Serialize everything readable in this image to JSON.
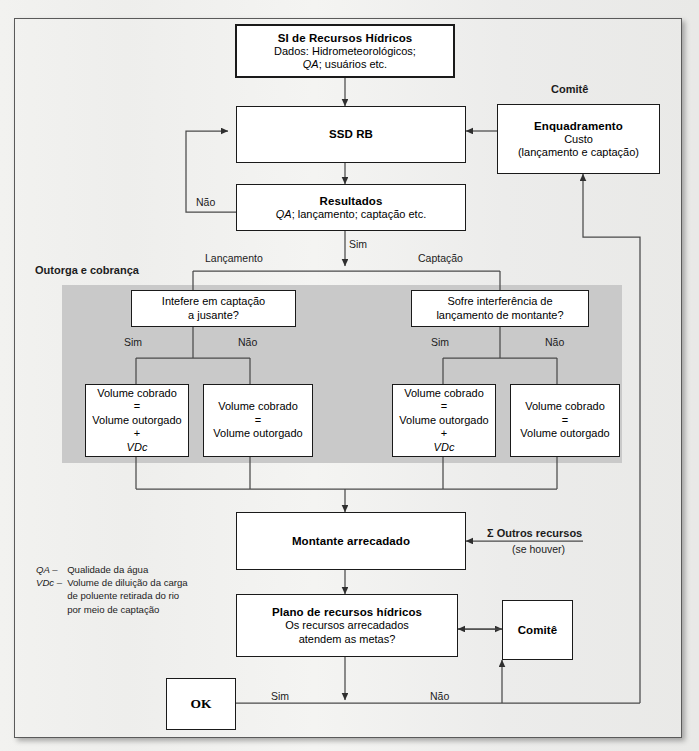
{
  "diagram": {
    "section_labels": {
      "outorga": "Outorga e cobrança",
      "comite_top": "Comitê"
    },
    "nodes": {
      "si": {
        "title": "SI de Recursos Hídricos",
        "line2": "Dados: Hidrometeorológicos;",
        "line3_italic": "QA",
        "line3_rest": "; usuários etc."
      },
      "ssd": {
        "title": "SSD RB"
      },
      "resultados": {
        "title": "Resultados",
        "line2_italic": "QA",
        "line2_rest": "; lançamento; captação etc."
      },
      "enquadramento": {
        "title": "Enquadramento",
        "line2": "Custo",
        "line3": "(lançamento e captação)"
      },
      "dec_left": {
        "line1": "Intefere em captação",
        "line2": "a jusante?"
      },
      "dec_right": {
        "line1": "Sofre interferência de",
        "line2": "lançamento de montante?"
      },
      "vol1": {
        "l1": "Volume cobrado",
        "l2": "=",
        "l3": "Volume outorgado",
        "l4": "+",
        "l5": "VDc"
      },
      "vol2": {
        "l1": "Volume cobrado",
        "l2": "=",
        "l3": "Volume outorgado"
      },
      "vol3": {
        "l1": "Volume cobrado",
        "l2": "=",
        "l3": "Volume outorgado",
        "l4": "+",
        "l5": "VDc"
      },
      "vol4": {
        "l1": "Volume cobrado",
        "l2": "=",
        "l3": "Volume outorgado"
      },
      "montante": {
        "title": "Montante arrecadado"
      },
      "plano": {
        "title": "Plano de recursos hídricos",
        "line2": "Os recursos arrecadados",
        "line3": "atendem as metas?"
      },
      "comite_box": {
        "title": "Comitê"
      },
      "ok": {
        "title": "OK"
      }
    },
    "edge_labels": {
      "nao_ssd": "Não",
      "sim_resultados": "Sim",
      "lancamento": "Lançamento",
      "captacao": "Captação",
      "sim_left": "Sim",
      "nao_left": "Não",
      "sim_right": "Sim",
      "nao_right": "Não",
      "outros_recursos": "Σ Outros recursos",
      "se_houver": "(se houver)",
      "sim_bottom": "Sim",
      "nao_bottom": "Não"
    },
    "legend": [
      {
        "key": "QA –",
        "value": "Qualidade da água"
      },
      {
        "key": "VDc –",
        "value": "Volume de diluição da carga\nde poluente retirada do rio\npor meio de captação"
      }
    ],
    "colors": {
      "line": "#3a3a3a",
      "box_border": "#1a1a1a",
      "shade": "#c9c9c9",
      "paper": "#eeeeec"
    }
  }
}
